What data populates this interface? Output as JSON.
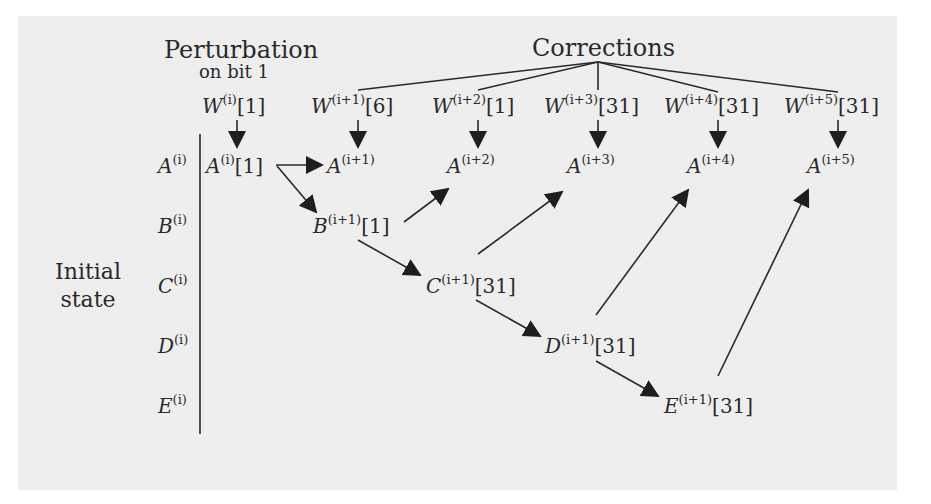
{
  "headers": {
    "perturbation": "Perturbation",
    "perturbation_sub": "on bit 1",
    "corrections": "Corrections",
    "initial_state_line1": "Initial",
    "initial_state_line2": "state"
  },
  "message_words": [
    {
      "base": "W",
      "exp": "(i)",
      "bit": "[1]"
    },
    {
      "base": "W",
      "exp": "(i+1)",
      "bit": "[6]"
    },
    {
      "base": "W",
      "exp": "(i+2)",
      "bit": "[1]"
    },
    {
      "base": "W",
      "exp": "(i+3)",
      "bit": "[31]"
    },
    {
      "base": "W",
      "exp": "(i+4)",
      "bit": "[31]"
    },
    {
      "base": "W",
      "exp": "(i+5)",
      "bit": "[31]"
    }
  ],
  "initial_registers": [
    {
      "base": "A",
      "exp": "(i)"
    },
    {
      "base": "B",
      "exp": "(i)"
    },
    {
      "base": "C",
      "exp": "(i)"
    },
    {
      "base": "D",
      "exp": "(i)"
    },
    {
      "base": "E",
      "exp": "(i)"
    }
  ],
  "a_row": [
    {
      "base": "A",
      "exp": "(i)",
      "bit": "[1]"
    },
    {
      "base": "A",
      "exp": "(i+1)",
      "bit": ""
    },
    {
      "base": "A",
      "exp": "(i+2)",
      "bit": ""
    },
    {
      "base": "A",
      "exp": "(i+3)",
      "bit": ""
    },
    {
      "base": "A",
      "exp": "(i+4)",
      "bit": ""
    },
    {
      "base": "A",
      "exp": "(i+5)",
      "bit": ""
    }
  ],
  "diagonal_nodes": [
    {
      "base": "B",
      "exp": "(i+1)",
      "bit": "[1]"
    },
    {
      "base": "C",
      "exp": "(i+1)",
      "bit": "[31]"
    },
    {
      "base": "D",
      "exp": "(i+1)",
      "bit": "[31]"
    },
    {
      "base": "E",
      "exp": "(i+1)",
      "bit": "[31]"
    }
  ],
  "edges": [
    {
      "from": "Corrections",
      "to": "W(i+1)[6]",
      "type": "line"
    },
    {
      "from": "Corrections",
      "to": "W(i+2)[1]",
      "type": "line"
    },
    {
      "from": "Corrections",
      "to": "W(i+3)[31]",
      "type": "line"
    },
    {
      "from": "Corrections",
      "to": "W(i+4)[31]",
      "type": "line"
    },
    {
      "from": "Corrections",
      "to": "W(i+5)[31]",
      "type": "line"
    },
    {
      "from": "W(i)[1]",
      "to": "A(i)[1]",
      "type": "arrow"
    },
    {
      "from": "W(i+1)[6]",
      "to": "A(i+1)",
      "type": "arrow"
    },
    {
      "from": "W(i+2)[1]",
      "to": "A(i+2)",
      "type": "arrow"
    },
    {
      "from": "W(i+3)[31]",
      "to": "A(i+3)",
      "type": "arrow"
    },
    {
      "from": "W(i+4)[31]",
      "to": "A(i+4)",
      "type": "arrow"
    },
    {
      "from": "W(i+5)[31]",
      "to": "A(i+5)",
      "type": "arrow"
    },
    {
      "from": "A(i)[1]",
      "to": "A(i+1)",
      "type": "arrow"
    },
    {
      "from": "A(i)[1]",
      "to": "B(i+1)[1]",
      "type": "arrow"
    },
    {
      "from": "B(i+1)[1]",
      "to": "A(i+2)",
      "type": "arrow"
    },
    {
      "from": "B(i+1)[1]",
      "to": "C(i+1)[31]",
      "type": "arrow"
    },
    {
      "from": "C(i+1)[31]",
      "to": "A(i+3)",
      "type": "arrow"
    },
    {
      "from": "C(i+1)[31]",
      "to": "D(i+1)[31]",
      "type": "arrow"
    },
    {
      "from": "D(i+1)[31]",
      "to": "A(i+4)",
      "type": "arrow"
    },
    {
      "from": "D(i+1)[31]",
      "to": "E(i+1)[31]",
      "type": "arrow"
    },
    {
      "from": "E(i+1)[31]",
      "to": "A(i+5)",
      "type": "arrow"
    }
  ],
  "colors": {
    "background": "#eeeeee",
    "ink": "#2a2a2a",
    "margin": "#ffffff"
  }
}
